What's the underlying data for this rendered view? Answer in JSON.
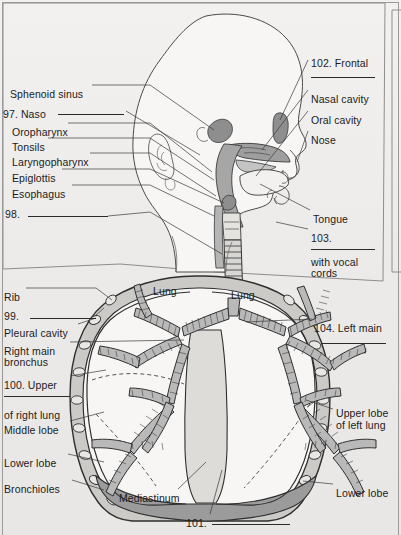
{
  "page": {
    "background_color": "#efeeec",
    "ink_color": "#1b1b1b",
    "width": 401,
    "height": 535
  },
  "upper_panel": {
    "name": "head-and-upper-airway-diagram",
    "labels_left": [
      {
        "text": "Sphenoid sinus",
        "x": 10,
        "y": 88
      },
      {
        "text": "97. Naso",
        "x": 3,
        "y": 108
      },
      {
        "text": "Oropharynx",
        "x": 12,
        "y": 126
      },
      {
        "text": "Tonsils",
        "x": 12,
        "y": 141
      },
      {
        "text": "Laryngopharynx",
        "x": 12,
        "y": 156
      },
      {
        "text": "Epiglottis",
        "x": 12,
        "y": 172
      },
      {
        "text": "Esophagus",
        "x": 12,
        "y": 188
      },
      {
        "text": "98.",
        "x": 5,
        "y": 208
      }
    ],
    "labels_right": [
      {
        "text": "102. Frontal",
        "x": 311,
        "y": 57
      },
      {
        "text": "Nasal cavity",
        "x": 311,
        "y": 93
      },
      {
        "text": "Oral cavity",
        "x": 311,
        "y": 114
      },
      {
        "text": "Nose",
        "x": 311,
        "y": 134
      },
      {
        "text": "Tongue",
        "x": 313,
        "y": 213
      },
      {
        "text": "103.",
        "x": 311,
        "y": 232
      },
      {
        "text": "with vocal",
        "x": 311,
        "y": 256
      },
      {
        "text": "cords",
        "x": 311,
        "y": 267
      }
    ],
    "answer_blanks": [
      {
        "name": "blank-102",
        "x": 311,
        "y": 77,
        "width": 64
      },
      {
        "name": "blank-97",
        "x": 58,
        "y": 114,
        "width": 66
      },
      {
        "name": "blank-98",
        "x": 28,
        "y": 216,
        "width": 80
      },
      {
        "name": "blank-103",
        "x": 311,
        "y": 249,
        "width": 64
      }
    ]
  },
  "lower_panel": {
    "name": "thorax-and-lungs-diagram",
    "labels_left": [
      {
        "text": "Rib",
        "x": 4,
        "y": 291
      },
      {
        "text": "99.",
        "x": 4,
        "y": 310
      },
      {
        "text": "Pleural cavity",
        "x": 4,
        "y": 327
      },
      {
        "text": "Right main",
        "x": 4,
        "y": 345
      },
      {
        "text": "bronchus",
        "x": 4,
        "y": 356
      },
      {
        "text": "100. Upper",
        "x": 4,
        "y": 379
      },
      {
        "text": "of right lung",
        "x": 4,
        "y": 409
      },
      {
        "text": "Middle lobe",
        "x": 4,
        "y": 424
      },
      {
        "text": "Lower lobe",
        "x": 4,
        "y": 457
      },
      {
        "text": "Bronchioles",
        "x": 4,
        "y": 483
      }
    ],
    "labels_right": [
      {
        "text": "104. Left main",
        "x": 314,
        "y": 322
      },
      {
        "text": "Upper lobe",
        "x": 336,
        "y": 407
      },
      {
        "text": "of left lung",
        "x": 336,
        "y": 419
      },
      {
        "text": "Lower lobe",
        "x": 336,
        "y": 487
      }
    ],
    "labels_inner": [
      {
        "text": "Lung",
        "x": 153,
        "y": 285
      },
      {
        "text": "Lung",
        "x": 231,
        "y": 289
      },
      {
        "text": "Mediastinum",
        "x": 119,
        "y": 492
      },
      {
        "text": "101.",
        "x": 186,
        "y": 517
      }
    ],
    "answer_blanks": [
      {
        "name": "blank-99",
        "x": 30,
        "y": 318,
        "width": 66
      },
      {
        "name": "blank-100",
        "x": 4,
        "y": 396,
        "width": 66
      },
      {
        "name": "blank-104",
        "x": 322,
        "y": 343,
        "width": 64
      },
      {
        "name": "blank-101",
        "x": 212,
        "y": 524,
        "width": 78
      }
    ]
  },
  "colors": {
    "paper": "#efeeec",
    "outline": "#3a3a3a",
    "airway_fill": "#a8a8a8",
    "cavity_fill": "#c9c9c9",
    "lung_field": "#f6f5f3",
    "pleura_fill": "#cfcecb",
    "diaphragm_fill": "#9b9b9b",
    "bronchi_fill": "#b9b9b9"
  }
}
